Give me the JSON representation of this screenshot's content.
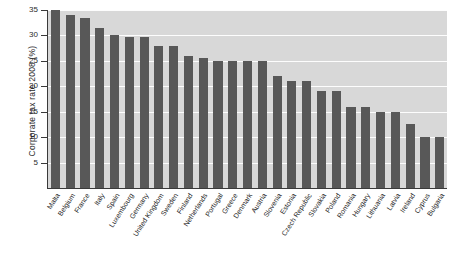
{
  "chart_data": {
    "type": "bar",
    "title": "",
    "xlabel": "",
    "ylabel": "Corporate tax rate 2008 (%)",
    "ylim": [
      0,
      35
    ],
    "yticks": [
      5,
      10,
      15,
      20,
      25,
      30,
      35
    ],
    "grid": true,
    "legend": false,
    "categories": [
      "Malta",
      "Belgium",
      "France",
      "Italy",
      "Spain",
      "Luxembourg",
      "Germany",
      "United Kingdom",
      "Sweden",
      "Finland",
      "Netherlands",
      "Portugal",
      "Greece",
      "Denmark",
      "Austria",
      "Slovenia",
      "Estonia",
      "Czech Republic",
      "Slovakia",
      "Poland",
      "Romania",
      "Hungary",
      "Lithuania",
      "Latvia",
      "Ireland",
      "Cyprus",
      "Bulgaria"
    ],
    "values": [
      35.0,
      34.0,
      33.5,
      31.4,
      30.0,
      29.6,
      29.6,
      28.0,
      28.0,
      26.0,
      25.5,
      25.0,
      25.0,
      25.0,
      25.0,
      22.0,
      21.0,
      21.0,
      19.0,
      19.0,
      16.0,
      16.0,
      15.0,
      15.0,
      12.5,
      10.0,
      10.0
    ],
    "series_name": "Corporate tax rate 2008"
  },
  "colors": {
    "bar": "#585858",
    "plot_background": "#d8d8d8",
    "gridline": "#ffffff",
    "axis": "#3a3a3a",
    "text": "#1f1f1f",
    "page_background": "#ffffff"
  }
}
